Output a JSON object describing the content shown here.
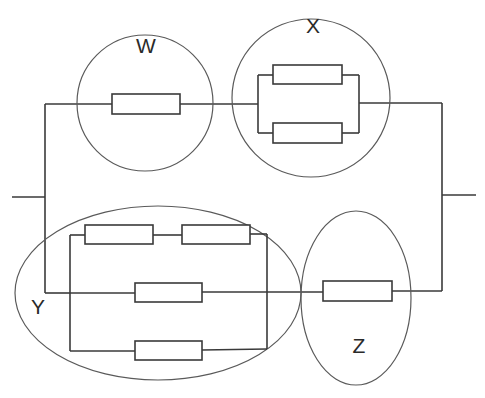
{
  "diagram": {
    "type": "circuit",
    "groups": [
      {
        "id": "W",
        "label": "W",
        "shape": "circle",
        "resistors": 1,
        "arrangement": "single"
      },
      {
        "id": "X",
        "label": "X",
        "shape": "circle",
        "resistors": 2,
        "arrangement": "2 in parallel"
      },
      {
        "id": "Y",
        "label": "Y",
        "shape": "ellipse",
        "resistors": 4,
        "arrangement": "two in series, in parallel with two single branches"
      },
      {
        "id": "Z",
        "label": "Z",
        "shape": "ellipse",
        "resistors": 1,
        "arrangement": "single"
      }
    ],
    "topology": "W and X in series on top branch; Y and Z in series on bottom branch; top and bottom branches in parallel between terminals",
    "colors": {
      "line": "#3a3a3a",
      "outline": "#5a5a5a",
      "background": "#ffffff"
    }
  }
}
